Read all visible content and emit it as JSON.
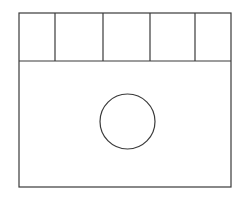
{
  "diagram": {
    "stroke_color": "#3a3a3a",
    "background_color": "#ffffff",
    "outer_frame": {
      "x": 19,
      "y": 13,
      "width": 212,
      "height": 174
    },
    "header_row": {
      "y_top": 13,
      "y_bottom": 61,
      "cell_dividers_x": [
        55,
        103,
        150,
        195
      ],
      "cells": [
        {
          "x0": 19,
          "x1": 55
        },
        {
          "x0": 55,
          "x1": 103
        },
        {
          "x0": 103,
          "x1": 150
        },
        {
          "x0": 150,
          "x1": 195
        },
        {
          "x0": 195,
          "x1": 231
        }
      ]
    },
    "body_panel": {
      "x": 19,
      "y": 61,
      "width": 212,
      "height": 126
    },
    "circle": {
      "cx": 127.5,
      "cy": 121.5,
      "r": 27.5
    }
  }
}
